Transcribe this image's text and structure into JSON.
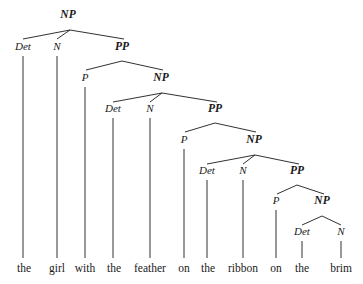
{
  "figure": {
    "kind": "syntactic-parse-tree",
    "sentence": "the girl with the feather on the ribbon on the brim",
    "width": 363,
    "height": 284,
    "background_color": "#ffffff",
    "ink_color": "#1a1a1a"
  },
  "nodes": [
    {
      "id": "np1",
      "label": "NP",
      "type": "phrase",
      "x": 68,
      "y": 18
    },
    {
      "id": "det1",
      "label": "Det",
      "type": "pos",
      "x": 23,
      "y": 50
    },
    {
      "id": "n1",
      "label": "N",
      "type": "pos",
      "x": 57,
      "y": 50
    },
    {
      "id": "pp1",
      "label": "PP",
      "type": "phrase",
      "x": 122,
      "y": 50
    },
    {
      "id": "p1",
      "label": "P",
      "type": "pos",
      "x": 85,
      "y": 81
    },
    {
      "id": "np2",
      "label": "NP",
      "type": "phrase",
      "x": 161,
      "y": 81
    },
    {
      "id": "det2",
      "label": "Det",
      "type": "pos",
      "x": 113,
      "y": 112
    },
    {
      "id": "n2",
      "label": "N",
      "type": "pos",
      "x": 150,
      "y": 112
    },
    {
      "id": "pp2",
      "label": "PP",
      "type": "phrase",
      "x": 215,
      "y": 112
    },
    {
      "id": "p2",
      "label": "P",
      "type": "pos",
      "x": 184,
      "y": 143
    },
    {
      "id": "np3",
      "label": "NP",
      "type": "phrase",
      "x": 254,
      "y": 143
    },
    {
      "id": "det3",
      "label": "Det",
      "type": "pos",
      "x": 207,
      "y": 174
    },
    {
      "id": "n3",
      "label": "N",
      "type": "pos",
      "x": 243,
      "y": 174
    },
    {
      "id": "pp3",
      "label": "PP",
      "type": "phrase",
      "x": 297,
      "y": 174
    },
    {
      "id": "p3",
      "label": "P",
      "type": "pos",
      "x": 276,
      "y": 204
    },
    {
      "id": "np4",
      "label": "NP",
      "type": "phrase",
      "x": 322,
      "y": 204
    },
    {
      "id": "det4",
      "label": "Det",
      "type": "pos",
      "x": 302,
      "y": 235
    },
    {
      "id": "n4",
      "label": "N",
      "type": "pos",
      "x": 341,
      "y": 235
    }
  ],
  "branches": [
    {
      "from": "np1",
      "to": "det1",
      "x1": 70,
      "y1": 30,
      "x2": 23,
      "y2": 39
    },
    {
      "from": "np1",
      "to": "n1",
      "x1": 70,
      "y1": 30,
      "x2": 57,
      "y2": 39
    },
    {
      "from": "np1",
      "to": "pp1",
      "x1": 70,
      "y1": 30,
      "x2": 124,
      "y2": 39
    },
    {
      "from": "pp1",
      "to": "p1",
      "x1": 122,
      "y1": 61,
      "x2": 86,
      "y2": 70
    },
    {
      "from": "pp1",
      "to": "np2",
      "x1": 122,
      "y1": 61,
      "x2": 163,
      "y2": 70
    },
    {
      "from": "np2",
      "to": "det2",
      "x1": 162,
      "y1": 93,
      "x2": 113,
      "y2": 102
    },
    {
      "from": "np2",
      "to": "n2",
      "x1": 162,
      "y1": 93,
      "x2": 150,
      "y2": 102
    },
    {
      "from": "np2",
      "to": "pp2",
      "x1": 162,
      "y1": 93,
      "x2": 217,
      "y2": 102
    },
    {
      "from": "pp2",
      "to": "p2",
      "x1": 215,
      "y1": 123,
      "x2": 185,
      "y2": 132
    },
    {
      "from": "pp2",
      "to": "np3",
      "x1": 215,
      "y1": 123,
      "x2": 256,
      "y2": 132
    },
    {
      "from": "np3",
      "to": "det3",
      "x1": 255,
      "y1": 155,
      "x2": 207,
      "y2": 164
    },
    {
      "from": "np3",
      "to": "n3",
      "x1": 255,
      "y1": 155,
      "x2": 243,
      "y2": 164
    },
    {
      "from": "np3",
      "to": "pp3",
      "x1": 255,
      "y1": 155,
      "x2": 299,
      "y2": 164
    },
    {
      "from": "pp3",
      "to": "p3",
      "x1": 297,
      "y1": 185,
      "x2": 277,
      "y2": 194
    },
    {
      "from": "pp3",
      "to": "np4",
      "x1": 297,
      "y1": 185,
      "x2": 324,
      "y2": 194
    },
    {
      "from": "np4",
      "to": "det4",
      "x1": 322,
      "y1": 216,
      "x2": 302,
      "y2": 225
    },
    {
      "from": "np4",
      "to": "n4",
      "x1": 322,
      "y1": 216,
      "x2": 341,
      "y2": 225
    }
  ],
  "leaves": [
    {
      "id": "w1",
      "word": "the",
      "x": 24,
      "y": 272,
      "stem_x": 23,
      "stem_top": 56,
      "stem_bottom": 258,
      "parent": "det1"
    },
    {
      "id": "w2",
      "word": "girl",
      "x": 57,
      "y": 272,
      "stem_x": 57,
      "stem_top": 56,
      "stem_bottom": 258,
      "parent": "n1"
    },
    {
      "id": "w3",
      "word": "with",
      "x": 85,
      "y": 272,
      "stem_x": 85,
      "stem_top": 87,
      "stem_bottom": 258,
      "parent": "p1"
    },
    {
      "id": "w4",
      "word": "the",
      "x": 114,
      "y": 272,
      "stem_x": 113,
      "stem_top": 118,
      "stem_bottom": 258,
      "parent": "det2"
    },
    {
      "id": "w5",
      "word": "feather",
      "x": 150,
      "y": 272,
      "stem_x": 150,
      "stem_top": 118,
      "stem_bottom": 258,
      "parent": "n2"
    },
    {
      "id": "w6",
      "word": "on",
      "x": 184,
      "y": 272,
      "stem_x": 184,
      "stem_top": 149,
      "stem_bottom": 258,
      "parent": "p2"
    },
    {
      "id": "w7",
      "word": "the",
      "x": 208,
      "y": 272,
      "stem_x": 207,
      "stem_top": 180,
      "stem_bottom": 258,
      "parent": "det3"
    },
    {
      "id": "w8",
      "word": "ribbon",
      "x": 243,
      "y": 272,
      "stem_x": 243,
      "stem_top": 180,
      "stem_bottom": 258,
      "parent": "n3"
    },
    {
      "id": "w9",
      "word": "on",
      "x": 276,
      "y": 272,
      "stem_x": 276,
      "stem_top": 210,
      "stem_bottom": 258,
      "parent": "p3"
    },
    {
      "id": "w10",
      "word": "the",
      "x": 302,
      "y": 272,
      "stem_x": 302,
      "stem_top": 241,
      "stem_bottom": 258,
      "parent": "det4"
    },
    {
      "id": "w11",
      "word": "brim",
      "x": 341,
      "y": 272,
      "stem_x": 341,
      "stem_top": 241,
      "stem_bottom": 258,
      "parent": "n4"
    }
  ]
}
